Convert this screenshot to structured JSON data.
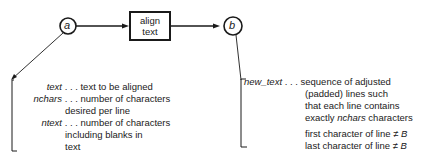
{
  "diagram": {
    "input_node": {
      "label": "a"
    },
    "process": {
      "line1": "align",
      "line2": "text"
    },
    "output_node": {
      "label": "b"
    },
    "inputs": [
      {
        "name": "text",
        "dots": " . . . ",
        "desc": [
          "text to be aligned"
        ]
      },
      {
        "name": "nchars",
        "dots": " . . . ",
        "desc": [
          "number of characters",
          "desired per line"
        ]
      },
      {
        "name": "ntext",
        "dots": " . . . ",
        "desc": [
          "number of characters",
          "including blanks  in",
          "text"
        ]
      }
    ],
    "outputs": [
      {
        "name": "new_text",
        "dots": " . . . ",
        "desc": [
          "sequence of adjusted",
          "(padded) lines such",
          "that each line contains"
        ],
        "desc_last_pre": "exactly ",
        "desc_last_italic": "nchars",
        "desc_last_post": " characters"
      }
    ],
    "conditions": [
      {
        "text": "first character of line ≠ ",
        "symbol": "B"
      },
      {
        "text": "last character of line ≠ ",
        "symbol": "B"
      }
    ]
  }
}
